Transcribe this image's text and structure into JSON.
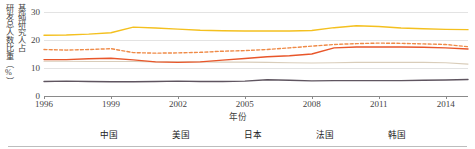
{
  "axes": {
    "ylabel": "基础研究人占研发总人数比重（%）",
    "ylabel_col1": "基础研究人占",
    "ylabel_col2": "研发总人数比重（%）",
    "xlabel": "年份",
    "yticks": [
      "0",
      "10",
      "20",
      "30"
    ],
    "xticks": [
      "1996",
      "1999",
      "2002",
      "2005",
      "2008",
      "2011",
      "2014"
    ]
  },
  "legend": [
    {
      "label": "中国",
      "color": "#5f5560",
      "style": "solid"
    },
    {
      "label": "美国",
      "color": "#ef8a47",
      "style": "dashed"
    },
    {
      "label": "日本",
      "color": "#d9cdba",
      "style": "solid"
    },
    {
      "label": "法国",
      "color": "#f4c01f",
      "style": "solid"
    },
    {
      "label": "韩国",
      "color": "#e8562a",
      "style": "solid"
    }
  ],
  "colors": {
    "china": "#5f5560",
    "usa": "#ef8a47",
    "japan": "#d9cdba",
    "france": "#f4c01f",
    "korea": "#e8562a",
    "grid": "#e3e3e3",
    "axis": "#8a8a8a",
    "text": "#3d3d3d"
  },
  "chart_data": {
    "type": "line",
    "title": "",
    "xlabel": "年份",
    "ylabel": "基础研究人占研发总人数比重（%）",
    "xlim": [
      1996,
      2015
    ],
    "ylim": [
      0,
      30
    ],
    "ytick_values": [
      0,
      10,
      20,
      30
    ],
    "grid": true,
    "legend_position": "bottom",
    "x": [
      1996,
      1997,
      1998,
      1999,
      2000,
      2001,
      2002,
      2003,
      2004,
      2005,
      2006,
      2007,
      2008,
      2009,
      2010,
      2011,
      2012,
      2013,
      2014,
      2015
    ],
    "series": [
      {
        "name": "中国",
        "color": "#5f5560",
        "style": "solid",
        "values": [
          5.2,
          5.3,
          5.2,
          5.1,
          5.1,
          5.2,
          5.3,
          5.2,
          5.2,
          5.3,
          5.8,
          5.6,
          5.4,
          5.5,
          5.5,
          5.5,
          5.5,
          5.6,
          5.7,
          5.9
        ]
      },
      {
        "name": "美国",
        "color": "#ef8a47",
        "style": "dashed",
        "values": [
          16.6,
          16.4,
          16.6,
          16.9,
          15.5,
          15.3,
          15.4,
          15.6,
          16.0,
          16.2,
          16.6,
          17.2,
          17.8,
          18.4,
          18.7,
          18.9,
          18.8,
          18.6,
          18.4,
          17.6
        ]
      },
      {
        "name": "日本",
        "color": "#d9cdba",
        "style": "solid",
        "values": [
          12.4,
          12.4,
          12.3,
          12.3,
          12.3,
          12.2,
          12.2,
          12.2,
          12.1,
          12.1,
          12.0,
          11.9,
          11.8,
          11.9,
          12.0,
          12.0,
          12.0,
          12.0,
          11.9,
          11.4
        ]
      },
      {
        "name": "法国",
        "color": "#f4c01f",
        "style": "solid",
        "values": [
          21.7,
          21.8,
          22.1,
          22.6,
          24.6,
          24.3,
          23.9,
          23.5,
          23.3,
          23.2,
          23.2,
          23.2,
          23.4,
          24.4,
          25.1,
          24.8,
          24.3,
          24.0,
          23.8,
          23.7
        ]
      },
      {
        "name": "韩国",
        "color": "#e8562a",
        "style": "solid",
        "values": [
          13.0,
          13.0,
          13.3,
          13.5,
          12.9,
          12.2,
          12.0,
          12.2,
          12.8,
          13.4,
          14.0,
          14.4,
          15.0,
          17.2,
          17.5,
          17.5,
          17.5,
          17.4,
          17.2,
          16.8
        ]
      }
    ]
  }
}
